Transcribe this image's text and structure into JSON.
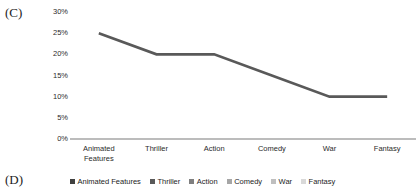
{
  "panels": {
    "c_label": "(C)",
    "d_label": "(D)"
  },
  "chart_data": {
    "type": "line",
    "title": "",
    "xlabel": "",
    "ylabel": "",
    "ylim": [
      0,
      30
    ],
    "ytick_labels": [
      "30%",
      "25%",
      "20%",
      "15%",
      "10%",
      "5%",
      "0%"
    ],
    "ytick_values": [
      30,
      25,
      20,
      15,
      10,
      5,
      0
    ],
    "grid": false,
    "legend_position": "bottom",
    "categories": [
      "Animated Features",
      "Thriller",
      "Action",
      "Comedy",
      "War",
      "Fantasy"
    ],
    "category_lines": [
      [
        "Animated",
        "Features"
      ],
      [
        "Thriller"
      ],
      [
        "Action"
      ],
      [
        "Comedy"
      ],
      [
        "War"
      ],
      [
        "Fantasy"
      ]
    ],
    "values": [
      25,
      20,
      20,
      15,
      10,
      10
    ],
    "value_labels": [
      "25%",
      "20%",
      "20%",
      "15%",
      "10%",
      "10%"
    ],
    "series": [
      {
        "name": "Percentage",
        "values": [
          25,
          20,
          20,
          15,
          10,
          10
        ],
        "color": "#595959"
      }
    ],
    "line_color": "#595959",
    "axis_color": "#a6a6a6",
    "legend": [
      {
        "label": "Animated Features",
        "color": "#404040"
      },
      {
        "label": "Thriller",
        "color": "#595959"
      },
      {
        "label": "Action",
        "color": "#7f7f7f"
      },
      {
        "label": "Comedy",
        "color": "#a6a6a6"
      },
      {
        "label": "War",
        "color": "#bfbfbf"
      },
      {
        "label": "Fantasy",
        "color": "#d9d9d9"
      }
    ]
  }
}
